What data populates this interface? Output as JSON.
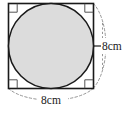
{
  "figure": {
    "kind": "geometry-diagram",
    "square": {
      "side_label": "8cm",
      "side_length_value": 8,
      "units": "cm",
      "stroke_color": "#1a1a1a",
      "fill_color": "#ffffff",
      "x": 8,
      "y": 3,
      "size": 85
    },
    "star": {
      "name": "astroid",
      "points": 4,
      "fill_color": "#dcdcdc",
      "stroke_color": "#1a1a1a"
    },
    "right_angle_markers": {
      "count": 4,
      "positions": [
        "top-left",
        "top-right",
        "bottom-left",
        "bottom-right"
      ],
      "stroke_color": "#555555"
    },
    "dimensions": [
      {
        "id": "right-side",
        "label": "8cm",
        "orientation": "vertical",
        "style": "dashed-arc",
        "placement": "right"
      },
      {
        "id": "bottom-side",
        "label": "8cm",
        "orientation": "horizontal",
        "style": "dashed-arc",
        "placement": "bottom"
      }
    ],
    "colors": {
      "outline": "#1a1a1a",
      "star_fill": "#dcdcdc",
      "dashed_guide": "#8a8a8a",
      "marker": "#555555",
      "background": "#ffffff"
    }
  }
}
